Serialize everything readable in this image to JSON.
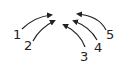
{
  "diagram": {
    "labels": [
      {
        "text": "1",
        "x": 13,
        "y": 28
      },
      {
        "text": "2",
        "x": 24,
        "y": 39
      },
      {
        "text": "3",
        "x": 80,
        "y": 50
      },
      {
        "text": "4",
        "x": 94,
        "y": 41
      },
      {
        "text": "5",
        "x": 106,
        "y": 28
      }
    ],
    "stroke_color": "#222222"
  }
}
